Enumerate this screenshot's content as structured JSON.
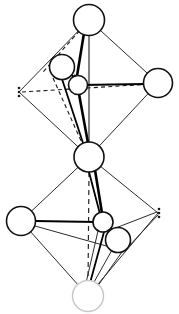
{
  "figure": {
    "canvas": {
      "width": 179,
      "height": 314,
      "background": "#ffffff"
    },
    "colors": {
      "line": "#1a1a1a",
      "bond": "#000000",
      "node_fill": "#ffffff",
      "node_stroke": "#111111",
      "faded_stroke": "#c9c9c9",
      "dot": "#1a1a1a"
    }
  },
  "atoms": [
    {
      "id": "apex-top",
      "name": "apex-top-atom",
      "cx": 89,
      "cy": 20,
      "r": 15.5,
      "style": "solid"
    },
    {
      "id": "equatorial-right-upper",
      "name": "equatorial-right-upper-atom",
      "cx": 158,
      "cy": 83,
      "r": 14.5,
      "style": "solid"
    },
    {
      "id": "center-upper-a",
      "name": "displaced-cation-upper-outer",
      "cx": 62,
      "cy": 67,
      "r": 12.5,
      "style": "solid"
    },
    {
      "id": "center-upper-b",
      "name": "displaced-cation-upper-inner",
      "cx": 78,
      "cy": 85,
      "r": 9.5,
      "style": "solid"
    },
    {
      "id": "shared-corner",
      "name": "shared-corner-atom",
      "cx": 89,
      "cy": 157,
      "r": 15.0,
      "style": "solid"
    },
    {
      "id": "equatorial-left-lower",
      "name": "equatorial-left-lower-atom",
      "cx": 21,
      "cy": 221,
      "r": 14.5,
      "style": "solid"
    },
    {
      "id": "center-lower-a",
      "name": "displaced-cation-lower-inner",
      "cx": 103,
      "cy": 222,
      "r": 10.0,
      "style": "solid"
    },
    {
      "id": "center-lower-b",
      "name": "displaced-cation-lower-outer",
      "cx": 118,
      "cy": 240,
      "r": 12.5,
      "style": "solid"
    },
    {
      "id": "apex-bottom",
      "name": "apex-bottom-atom",
      "cx": 88,
      "cy": 296,
      "r": 15.5,
      "style": "faded"
    }
  ],
  "implied_vertices": [
    {
      "id": "left-upper-vertex",
      "name": "implied-vertex-left-upper",
      "x": 19,
      "y": 92
    },
    {
      "id": "right-lower-vertex",
      "name": "implied-vertex-right-lower",
      "x": 158,
      "y": 213
    }
  ],
  "octahedra": [
    {
      "name": "upper-octahedron",
      "apex_top": "apex-top",
      "apex_bottom": "shared-corner"
    },
    {
      "name": "lower-octahedron",
      "apex_top": "shared-corner",
      "apex_bottom": "apex-bottom"
    }
  ],
  "annotations": {
    "displacement_arrows": [
      {
        "name": "displacement-arrow-upper",
        "from": [
          66,
          70
        ],
        "to": [
          79,
          82
        ]
      },
      {
        "name": "displacement-arrow-lower",
        "from": [
          107,
          225
        ],
        "to": [
          120,
          237
        ]
      }
    ],
    "symmetry_axis": {
      "name": "symmetry-axis",
      "label": "vertical dashed axis"
    }
  }
}
